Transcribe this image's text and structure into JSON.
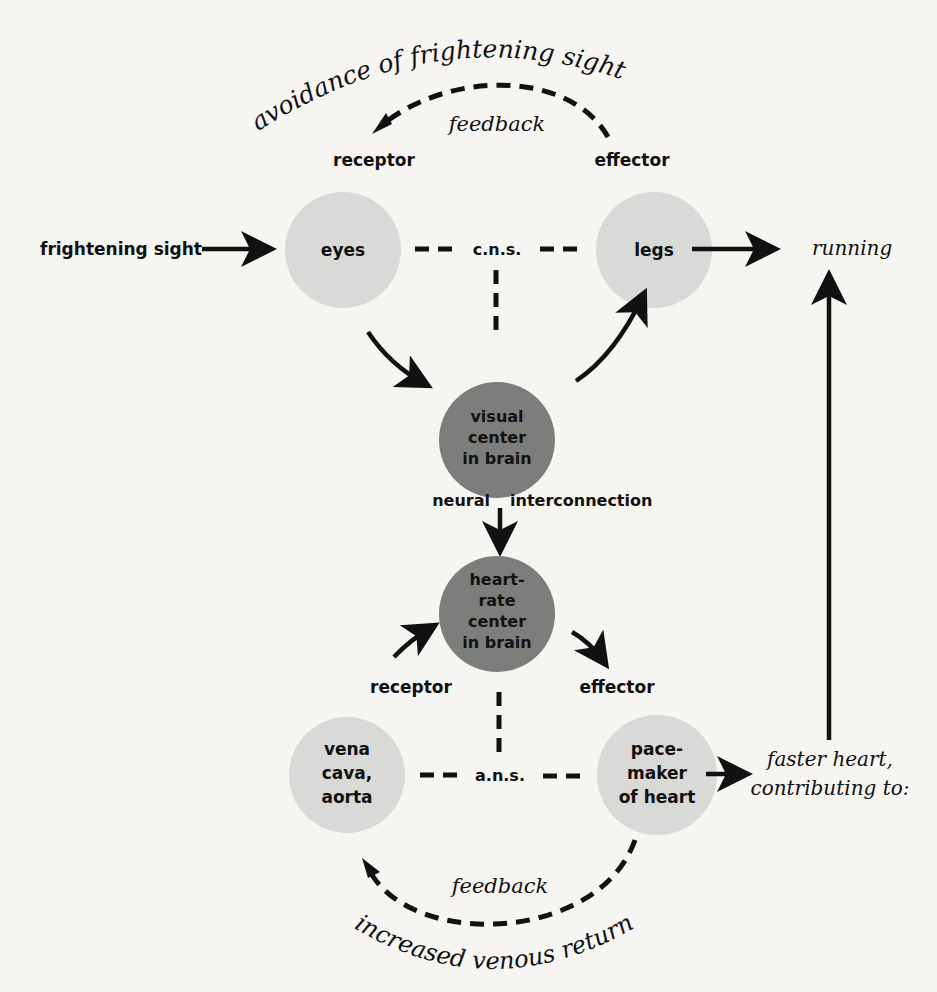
{
  "diagram": {
    "type": "reflex-feedback-diagram",
    "top_loop": {
      "arc_label": "avoidance of frightening sight",
      "feedback_label": "feedback",
      "receptor_label": "receptor",
      "effector_label": "effector"
    },
    "stimulus": "frightening sight",
    "nodes": {
      "eyes": {
        "lines": [
          "eyes"
        ],
        "shade": "light"
      },
      "legs": {
        "lines": [
          "legs"
        ],
        "shade": "light"
      },
      "visual_center": {
        "lines": [
          "visual",
          "center",
          "in brain"
        ],
        "shade": "dark"
      },
      "heart_rate_center": {
        "lines": [
          "heart-",
          "rate",
          "center",
          "in brain"
        ],
        "shade": "dark"
      },
      "vena_cava": {
        "lines": [
          "vena",
          "cava,",
          "aorta"
        ],
        "shade": "light"
      },
      "pacemaker": {
        "lines": [
          "pace-",
          "maker",
          "of heart"
        ],
        "shade": "light"
      }
    },
    "cns_label": "c.n.s.",
    "response": "running",
    "neural_left": "neural",
    "neural_right": "interconnection",
    "bottom_loop": {
      "receptor_label": "receptor",
      "effector_label": "effector",
      "ans_label": "a.n.s.",
      "feedback_label": "feedback",
      "arc_label": "increased venous return"
    },
    "heart_output": [
      "faster heart,",
      "contributing to:"
    ],
    "colors": {
      "background": "#f6f5f2",
      "light_node": "#d9d9d7",
      "dark_node": "#7d7d7b",
      "ink": "#111111"
    }
  }
}
